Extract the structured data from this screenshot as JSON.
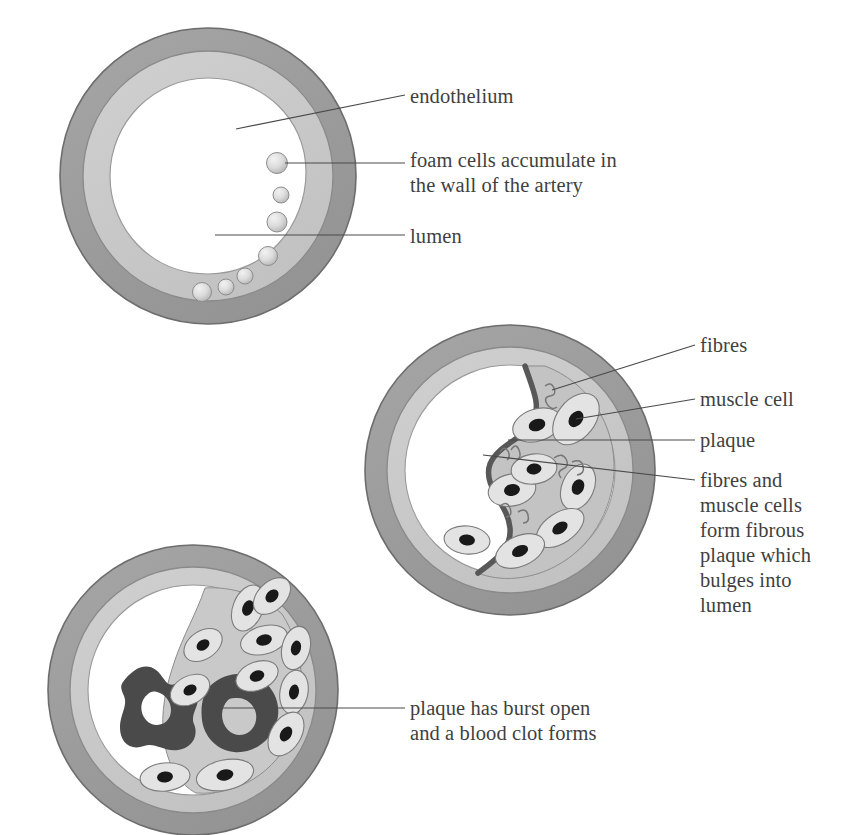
{
  "figure": {
    "background_color": "#ffffff",
    "text_color": "#3f3f3f",
    "colors": {
      "outer_wall": "#9a9a9a",
      "outer_wall_stroke": "#6d6d6d",
      "inner_wall": "#c9c9c9",
      "inner_wall_stroke": "#8a8a8a",
      "lumen": "#ffffff",
      "plaque_fill": "#c3c3c3",
      "plaque_cap": "#5a5a5a",
      "muscle_cell_fill": "#e0e0e0",
      "muscle_cell_stroke": "#7b7b7b",
      "nucleus": "#1d1d1d",
      "fibre_stroke": "#767676",
      "foam_cell_fill": "#d6d6d6",
      "foam_cell_stroke": "#8d8d8d",
      "blood_clot": "#4a4a4a",
      "leader_line": "#4a4a4a"
    }
  },
  "panels": [
    {
      "id": "panel-1",
      "name": "early-fatty-streak",
      "center_x": 208,
      "center_y": 176,
      "outer_radius": 148,
      "inner_radius": 125,
      "lumen_radius": 98,
      "foam_cell_count": 7
    },
    {
      "id": "panel-2",
      "name": "fibrous-plaque",
      "center_x": 510,
      "center_y": 470,
      "outer_radius": 145,
      "inner_radius": 123,
      "lumen_radius": 105,
      "muscle_cell_count": 8
    },
    {
      "id": "panel-3",
      "name": "ruptured-plaque-with-clot",
      "center_x": 193,
      "center_y": 690,
      "outer_radius": 145,
      "inner_radius": 123,
      "lumen_radius": 105,
      "muscle_cell_count": 11,
      "clot_count": 2
    }
  ],
  "labels": {
    "endothelium": "endothelium",
    "foam_cells": "foam cells accumulate in\nthe wall of the artery",
    "lumen": "lumen",
    "fibres": "fibres",
    "muscle_cell": "muscle cell",
    "plaque": "plaque",
    "fibrous_plaque": "fibres and\nmuscle cells\nform fibrous\nplaque which\nbulges into\nlumen",
    "burst": "plaque has burst open\nand a blood clot forms"
  }
}
